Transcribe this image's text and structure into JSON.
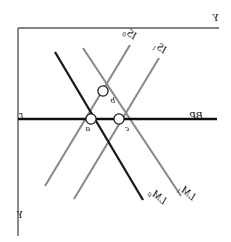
{
  "figure": {
    "width": 231,
    "height": 242,
    "background": "#ffffff",
    "mirrored": true
  },
  "colors": {
    "axis": "#5a5a5a",
    "curve_gray": "#8a8a8a",
    "curve_dark": "#1a1a1a",
    "bp_line": "#101010",
    "text": "#101010",
    "marker_fill": "#ffffff",
    "marker_stroke": "#1a1a1a"
  },
  "axes": {
    "top_rule": {
      "x1": 12,
      "y1": 28,
      "x2": 213,
      "y2": 28
    },
    "right_rule": {
      "x1": 213,
      "y1": 28,
      "x2": 213,
      "y2": 236
    },
    "vertical_label": "Y",
    "horizontal_label": "r",
    "bottom_label": "Y"
  },
  "curves": [
    {
      "name": "IS0",
      "label_text": "IS",
      "label_sub": "0",
      "color": "#8a8a8a",
      "slope_direction": "down-right",
      "x1": 101,
      "y1": 45,
      "x2": 186,
      "y2": 186
    },
    {
      "name": "IS1",
      "label_text": "IS",
      "label_sub": "1",
      "color": "#8a8a8a",
      "slope_direction": "down-right",
      "x1": 72,
      "y1": 58,
      "x2": 157,
      "y2": 199
    },
    {
      "name": "LM0",
      "label_text": "LM",
      "label_sub": "0",
      "color": "#1a1a1a",
      "slope_direction": "up-right",
      "x1": 88,
      "y1": 200,
      "x2": 176,
      "y2": 52
    },
    {
      "name": "LM1",
      "label_text": "LM",
      "label_sub": "1",
      "color": "#8a8a8a",
      "slope_direction": "up-right",
      "x1": 50,
      "y1": 196,
      "x2": 148,
      "y2": 48
    },
    {
      "name": "BP",
      "label_text": "BP",
      "label_sub": "",
      "color": "#101010",
      "slope_direction": "horizontal",
      "x1": 14,
      "y1": 119,
      "x2": 213,
      "y2": 119
    }
  ],
  "points": [
    {
      "name": "a",
      "label": "a",
      "x": 140,
      "y": 119
    },
    {
      "name": "b",
      "label": "b",
      "x": 128,
      "y": 91
    },
    {
      "name": "c",
      "label": "c",
      "x": 112,
      "y": 119
    }
  ],
  "chart_data": {
    "type": "line",
    "xlabel": "Y",
    "ylabel": "r",
    "grid": false,
    "legend": "inline-curve-labels",
    "series": [
      {
        "name": "IS0",
        "style": "downward-sloping",
        "color": "#8a8a8a"
      },
      {
        "name": "IS1",
        "style": "downward-sloping",
        "color": "#8a8a8a"
      },
      {
        "name": "LM0",
        "style": "upward-sloping",
        "color": "#1a1a1a"
      },
      {
        "name": "LM1",
        "style": "upward-sloping",
        "color": "#8a8a8a"
      },
      {
        "name": "BP",
        "style": "horizontal",
        "color": "#101010"
      }
    ],
    "annotations": [
      {
        "label": "a",
        "meaning": "intersection IS0 x LM0 on BP"
      },
      {
        "label": "b",
        "meaning": "intersection IS0 x LM1 above BP"
      },
      {
        "label": "c",
        "meaning": "intersection IS1 x LM1 on BP"
      }
    ]
  }
}
